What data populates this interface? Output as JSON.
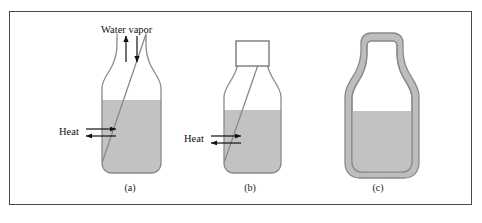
{
  "figure": {
    "border_color": "#4a4a4a",
    "background": "#ffffff"
  },
  "colors": {
    "liquid": "#c2c2c2",
    "glass_outline": "#8a8a8a",
    "wall_fill": "#bdbdbd",
    "arrow": "#111111",
    "text": "#111111"
  },
  "labels": {
    "water_vapor": "Water vapor",
    "heat_a": "Heat",
    "heat_b": "Heat"
  },
  "captions": {
    "a": "(a)",
    "b": "(b)",
    "c": "(c)"
  },
  "bottles": [
    {
      "id": "a",
      "caption": "(a)",
      "state": "open",
      "has_cap": false,
      "insulated": false,
      "liquid_level_y": 100,
      "arrows": [
        "vapor-up",
        "vapor-down",
        "heat-in",
        "heat-out"
      ]
    },
    {
      "id": "b",
      "caption": "(b)",
      "state": "closed",
      "has_cap": true,
      "insulated": false,
      "liquid_level_y": 110,
      "arrows": [
        "heat-in",
        "heat-out"
      ]
    },
    {
      "id": "c",
      "caption": "(c)",
      "state": "closed-insulated",
      "has_cap": false,
      "insulated": true,
      "liquid_level_y": 111,
      "arrows": []
    }
  ]
}
